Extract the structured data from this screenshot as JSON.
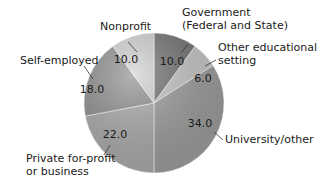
{
  "chart_data": {
    "type": "pie",
    "title": "",
    "start_angle_deg": 0,
    "direction": "clockwise",
    "slices": [
      {
        "label": "Government (Federal and State)",
        "label_lines": [
          "Government",
          "(Federal and State)"
        ],
        "value": 10.0,
        "value_text": "10.0",
        "color": "#6f6f6f"
      },
      {
        "label": "Other educational setting",
        "label_lines": [
          "Other educational",
          "setting"
        ],
        "value": 6.0,
        "value_text": "6.0",
        "color": "#c4c4c4"
      },
      {
        "label": "University/other",
        "label_lines": [
          "University/other"
        ],
        "value": 34.0,
        "value_text": "34.0",
        "color": "#9a9a9a"
      },
      {
        "label": "Private for-profit or business",
        "label_lines": [
          "Private for-profit",
          "or business"
        ],
        "value": 22.0,
        "value_text": "22.0",
        "color": "#a8a8a8"
      },
      {
        "label": "Self-employed",
        "label_lines": [
          "Self-employed"
        ],
        "value": 18.0,
        "value_text": "18.0",
        "color": "#8c8c8c"
      },
      {
        "label": "Nonprofit",
        "label_lines": [
          "Nonprofit"
        ],
        "value": 10.0,
        "value_text": "10.0",
        "color": "#cfcfcf"
      }
    ],
    "legend": "none (direct labels with leader lines)"
  }
}
